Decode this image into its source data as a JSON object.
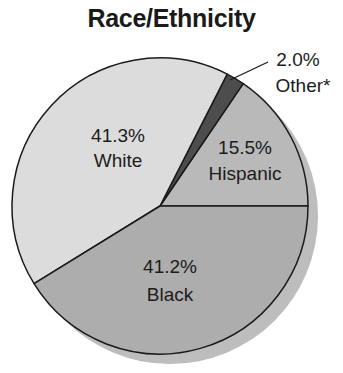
{
  "chart_data": {
    "type": "pie",
    "title": "Race/Ethnicity",
    "slices": [
      {
        "label": "Hispanic",
        "value": 15.5,
        "display": "15.5%",
        "color": "#b9b9b9"
      },
      {
        "label": "Other*",
        "value": 2.0,
        "display": "2.0%",
        "color": "#4d4d4d"
      },
      {
        "label": "White",
        "value": 41.3,
        "display": "41.3%",
        "color": "#dcdcdc"
      },
      {
        "label": "Black",
        "value": 41.2,
        "display": "41.2%",
        "color": "#adadad"
      }
    ],
    "start_angle_deg": 0,
    "direction": "counterclockwise",
    "shadow": true
  },
  "labels": {
    "hispanic_pct": "15.5%",
    "hispanic": "Hispanic",
    "other_pct": "2.0%",
    "other": "Other*",
    "white_pct": "41.3%",
    "white": "White",
    "black_pct": "41.2%",
    "black": "Black"
  }
}
